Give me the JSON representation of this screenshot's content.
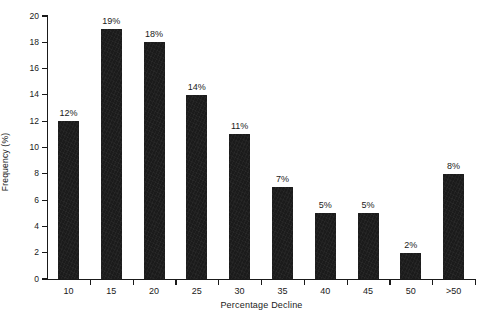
{
  "chart_data": {
    "type": "bar",
    "title": "",
    "xlabel": "Percentage Decline",
    "ylabel": "Frequency (%)",
    "categories": [
      "10",
      "15",
      "20",
      "25",
      "30",
      "35",
      "40",
      "45",
      "50",
      ">50"
    ],
    "values": [
      12,
      19,
      18,
      14,
      11,
      7,
      5,
      5,
      2,
      8
    ],
    "data_labels": [
      "12%",
      "19%",
      "18%",
      "14%",
      "11%",
      "7%",
      "5%",
      "5%",
      "2%",
      "8%"
    ],
    "ylim": [
      0,
      20
    ],
    "ytick_values": [
      0,
      2,
      4,
      6,
      8,
      10,
      12,
      14,
      16,
      18,
      20
    ],
    "ytick_labels": [
      "0",
      "2",
      "4",
      "6",
      "8",
      "10",
      "12",
      "14",
      "16",
      "18",
      "20"
    ],
    "grid": false,
    "legend": null,
    "bar_color": "#1b1b1b",
    "axis_color": "#1a1a1a",
    "background": "#ffffff"
  }
}
